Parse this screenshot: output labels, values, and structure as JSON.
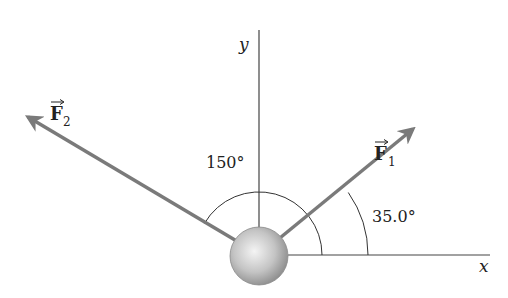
{
  "diagram": {
    "axes": {
      "x_label": "x",
      "y_label": "y"
    },
    "forces": [
      {
        "name": "F",
        "subscript": "1",
        "angle_label": "35.0°"
      },
      {
        "name": "F",
        "subscript": "2",
        "angle_label": "150°"
      }
    ],
    "colors": {
      "arrow": "#7a7a7a",
      "axis": "#333333",
      "ball_light": "#f2f2f2",
      "ball_dark": "#8c8c8c"
    }
  }
}
